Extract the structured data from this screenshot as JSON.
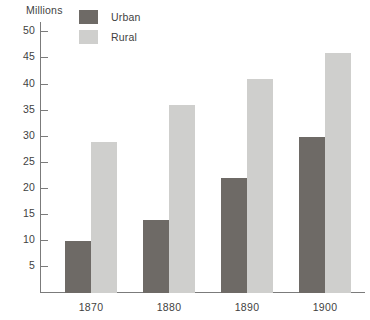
{
  "chart_data": {
    "type": "bar",
    "title": "",
    "subtitle": "",
    "xlabel": "",
    "ylabel": "Millions",
    "categories": [
      "1870",
      "1880",
      "1890",
      "1900"
    ],
    "series": [
      {
        "name": "Urban",
        "color": "#6e6a66",
        "values": [
          10,
          14,
          22,
          30
        ]
      },
      {
        "name": "Rural",
        "color": "#cfcfcd",
        "values": [
          29,
          36,
          41,
          46
        ]
      }
    ],
    "ylim": [
      0,
      52
    ],
    "y_ticks": [
      5,
      10,
      15,
      20,
      25,
      30,
      35,
      40,
      45,
      50
    ],
    "y_tick_labels": [
      "5",
      "10",
      "15",
      "20",
      "25",
      "30",
      "35",
      "40",
      "45",
      "50"
    ],
    "grid": false,
    "legend_position": "top",
    "axis_color": "#7b7b7b",
    "text_color": "#3f3f3f",
    "background": "#ffffff"
  },
  "legend": {
    "items": [
      {
        "label": "Urban",
        "swatch_color": "#6e6a66"
      },
      {
        "label": "Rural",
        "swatch_color": "#cfcfcd"
      }
    ]
  },
  "axis": {
    "unit_label": "Millions"
  }
}
